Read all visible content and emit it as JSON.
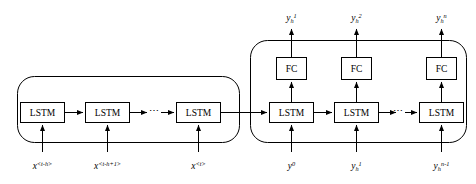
{
  "figure": {
    "type": "diagram",
    "stroke_color": "#000000",
    "box_fill": "#ffffff",
    "background": "#ffffff"
  },
  "encoder": {
    "name": "encoder-block",
    "cells": [
      {
        "label": "LSTM",
        "input": "x",
        "input_superscript": "<t-h>"
      },
      {
        "label": "LSTM",
        "input": "x",
        "input_superscript": "<t-h+1>"
      },
      {
        "label": "LSTM",
        "input": "x",
        "input_superscript": "<t>"
      }
    ],
    "ellipsis": "⋯"
  },
  "decoder": {
    "name": "decoder-block",
    "cells": [
      {
        "lstm_label": "LSTM",
        "fc_label": "FC",
        "output_base": "y",
        "output_subscript": "h",
        "output_superscript": "1",
        "input_base": "y",
        "input_subscript": "",
        "input_superscript": "0"
      },
      {
        "lstm_label": "LSTM",
        "fc_label": "FC",
        "output_base": "y",
        "output_subscript": "h",
        "output_superscript": "2",
        "input_base": "y",
        "input_subscript": "h",
        "input_superscript": "1"
      },
      {
        "lstm_label": "LSTM",
        "fc_label": "FC",
        "output_base": "y",
        "output_subscript": "h",
        "output_superscript": "n",
        "input_base": "y",
        "input_subscript": "h",
        "input_superscript": "n-1"
      }
    ],
    "ellipsis": "⋯"
  }
}
